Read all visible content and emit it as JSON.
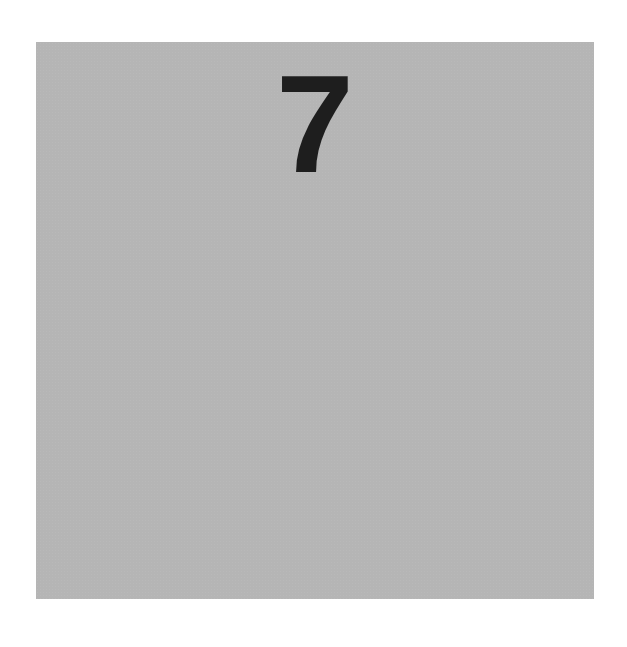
{
  "card": {
    "numeral": "7",
    "background_color": "#b5b5b5",
    "text_color": "#1e1e1e"
  }
}
